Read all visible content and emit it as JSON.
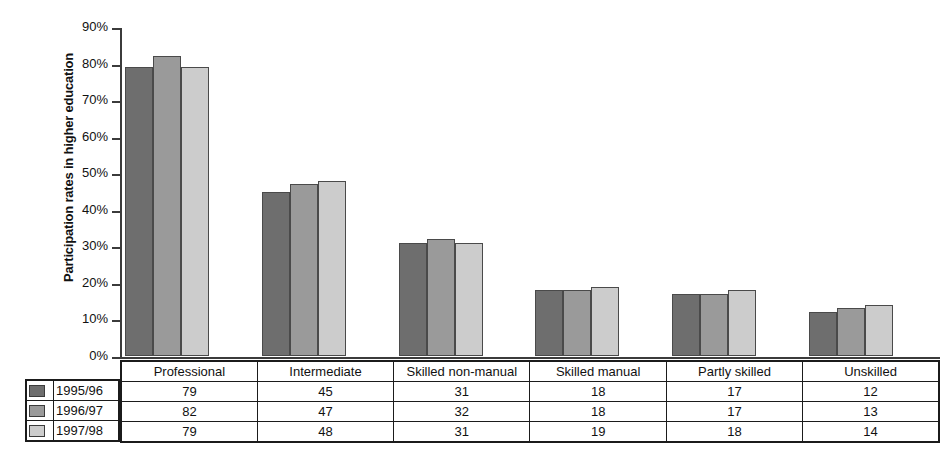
{
  "chart_data": {
    "type": "bar",
    "title": "",
    "subtitle": "",
    "xlabel": "",
    "ylabel": "Participation rates in higher education",
    "ylim": [
      0,
      90
    ],
    "ytick_labels": [
      "90%",
      "80%",
      "70%",
      "60%",
      "50%",
      "40%",
      "30%",
      "20%",
      "10%",
      "0%"
    ],
    "ytick_values": [
      90,
      80,
      70,
      60,
      50,
      40,
      30,
      20,
      10,
      0
    ],
    "grid": false,
    "legend_position": "bottom-table",
    "categories": [
      "Professional",
      "Intermediate",
      "Skilled non-manual",
      "Skilled manual",
      "Partly skilled",
      "Unskilled"
    ],
    "series": [
      {
        "name": "1995/96",
        "color": "#6e6e6e",
        "values": [
          79,
          45,
          31,
          18,
          17,
          12
        ]
      },
      {
        "name": "1996/97",
        "color": "#9a9a9a",
        "values": [
          82,
          47,
          32,
          18,
          17,
          13
        ]
      },
      {
        "name": "1997/98",
        "color": "#cccccc",
        "values": [
          79,
          48,
          31,
          19,
          18,
          14
        ]
      }
    ]
  },
  "table": {
    "row_header_label": "",
    "columns": [
      "Professional",
      "Intermediate",
      "Skilled non-manual",
      "Skilled manual",
      "Partly skilled",
      "Unskilled"
    ],
    "rows": [
      {
        "label": "1995/96",
        "swatch": "#6e6e6e",
        "values": [
          "79",
          "45",
          "31",
          "18",
          "17",
          "12"
        ]
      },
      {
        "label": "1996/97",
        "swatch": "#9a9a9a",
        "values": [
          "82",
          "47",
          "32",
          "18",
          "17",
          "13"
        ]
      },
      {
        "label": "1997/98",
        "swatch": "#cccccc",
        "values": [
          "79",
          "48",
          "31",
          "19",
          "18",
          "14"
        ]
      }
    ]
  }
}
